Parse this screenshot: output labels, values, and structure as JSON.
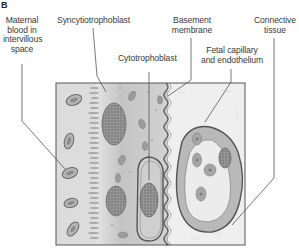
{
  "figure": {
    "panel_letter": "B",
    "labels": {
      "maternal_blood": [
        "Maternal",
        "blood in",
        "intervillous",
        "space"
      ],
      "syncytiotrophoblast": "Syncytiotrophoblast",
      "cytotrophoblast": "Cytotrophoblast",
      "basement_membrane": [
        "Basement",
        "membrane"
      ],
      "fetal_capillary": [
        "Fetal capillary",
        "and endothelium"
      ],
      "connective_tissue": [
        "Connective",
        "tissue"
      ]
    },
    "colors": {
      "maternal_space": "#d9d9d9",
      "syncytium": "#bdbdbd",
      "nucleus": "#8a8a8a",
      "connective": "#eeeeee",
      "outline": "#555555",
      "leader_line": "#555555",
      "text": "#3a3a3a"
    }
  }
}
